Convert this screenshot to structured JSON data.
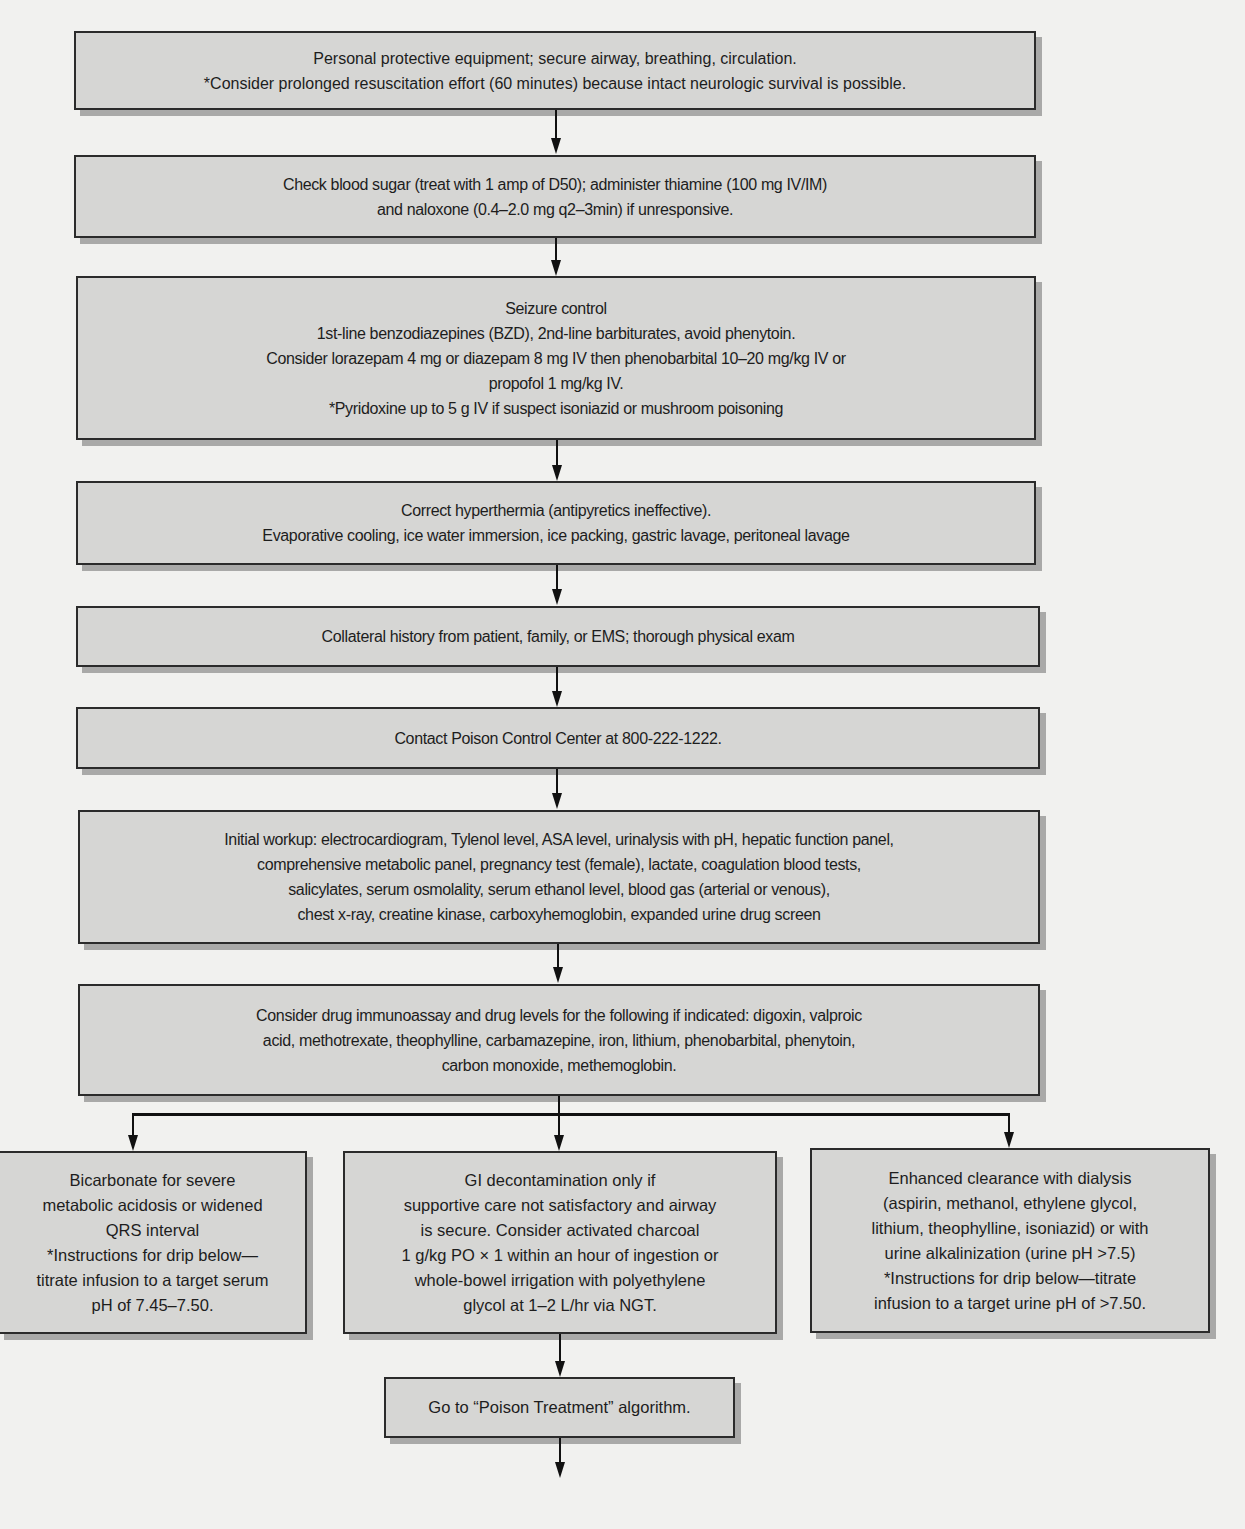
{
  "diagram": {
    "type": "flowchart",
    "colors": {
      "background": "#f1f1ef",
      "box_fill": "#d6d6d4",
      "box_border": "#2b2b2b",
      "connector": "#111111"
    },
    "steps": [
      {
        "id": "ppe",
        "lines": [
          "Personal protective equipment; secure airway, breathing, circulation.",
          "*Consider prolonged resuscitation effort (60 minutes) because intact neurologic survival is possible."
        ]
      },
      {
        "id": "blood-sugar",
        "lines": [
          "Check blood sugar (treat with 1 amp of D50); administer thiamine (100 mg IV/IM)",
          "and naloxone (0.4–2.0 mg q2–3min) if unresponsive."
        ]
      },
      {
        "id": "seizure",
        "lines": [
          "Seizure control",
          "1st-line benzodiazepines (BZD), 2nd-line barbiturates, avoid phenytoin.",
          "Consider lorazepam 4 mg or diazepam 8 mg IV then phenobarbital 10–20 mg/kg IV or",
          "propofol 1 mg/kg IV.",
          "*Pyridoxine up to 5 g IV if suspect isoniazid or mushroom poisoning"
        ]
      },
      {
        "id": "hyperthermia",
        "lines": [
          "Correct hyperthermia (antipyretics ineffective).",
          "Evaporative cooling, ice water immersion, ice packing, gastric lavage, peritoneal lavage"
        ]
      },
      {
        "id": "history",
        "lines": [
          "Collateral history from patient, family, or EMS; thorough physical exam"
        ]
      },
      {
        "id": "poison-control",
        "lines": [
          "Contact Poison Control Center at 800-222-1222."
        ]
      },
      {
        "id": "workup",
        "lines": [
          "Initial workup: electrocardiogram, Tylenol level, ASA level, urinalysis with pH, hepatic function panel,",
          "comprehensive metabolic panel, pregnancy test (female), lactate, coagulation blood tests,",
          "salicylates, serum osmolality, serum ethanol level, blood gas (arterial or venous),",
          "chest x-ray, creatine kinase, carboxyhemoglobin, expanded urine drug screen"
        ]
      },
      {
        "id": "drug-levels",
        "lines": [
          "Consider drug immunoassay and drug levels for the following if indicated: digoxin, valproic",
          "acid, methotrexate, theophylline, carbamazepine, iron, lithium, phenobarbital, phenytoin,",
          "carbon monoxide, methemoglobin."
        ]
      }
    ],
    "branches": [
      {
        "id": "bicarbonate",
        "lines": [
          "Bicarbonate for severe",
          "metabolic acidosis or widened",
          "QRS interval",
          "*Instructions for drip below—",
          "titrate infusion to a target serum",
          "pH of 7.45–7.50."
        ]
      },
      {
        "id": "gi-decontamination",
        "lines": [
          "GI decontamination only if",
          "supportive care not satisfactory and airway",
          "is secure. Consider activated charcoal",
          "1 g/kg PO × 1 within an hour of ingestion or",
          "whole-bowel irrigation with polyethylene",
          "glycol at 1–2 L/hr via NGT."
        ]
      },
      {
        "id": "enhanced-clearance",
        "lines": [
          "Enhanced clearance with dialysis",
          "(aspirin, methanol, ethylene glycol,",
          "lithium, theophylline, isoniazid) or with",
          "urine alkalinization (urine pH >7.5)",
          "*Instructions for drip below—titrate",
          "infusion to a target urine pH of >7.50."
        ]
      }
    ],
    "final": {
      "id": "poison-treatment",
      "lines": [
        "Go to “Poison Treatment” algorithm."
      ]
    }
  }
}
